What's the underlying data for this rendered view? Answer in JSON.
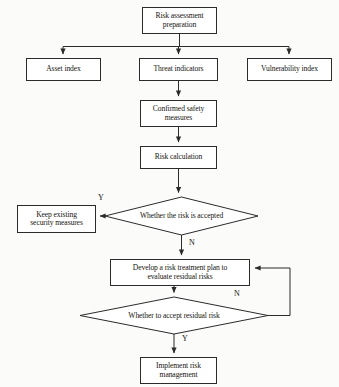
{
  "diagram": {
    "type": "flowchart",
    "background_color": "#fbfbfa",
    "stroke_color": "#2b2b2b",
    "node_fill": "#ffffff",
    "text_color": "#16150f",
    "nodes": [
      {
        "id": "start",
        "shape": "process",
        "label": "Risk assessment preparation",
        "line1": "Risk assessment",
        "line2": "preparation"
      },
      {
        "id": "asset",
        "shape": "process",
        "label": "Asset index",
        "line1": "Asset index",
        "line2": ""
      },
      {
        "id": "threat",
        "shape": "process",
        "label": "Threat indicators",
        "line1": "Threat indicators",
        "line2": ""
      },
      {
        "id": "vuln",
        "shape": "process",
        "label": "Vulnerability index",
        "line1": "Vulnerability index",
        "line2": ""
      },
      {
        "id": "confirmed",
        "shape": "process",
        "label": "Confirmed safety measures",
        "line1": "Confirmed safety",
        "line2": "measures"
      },
      {
        "id": "calc",
        "shape": "process",
        "label": "Risk calculation",
        "line1": "Risk calculation",
        "line2": ""
      },
      {
        "id": "accepted",
        "shape": "decision",
        "label": "Whether the risk is accepted",
        "line1": "Whether the risk is accepted",
        "line2": ""
      },
      {
        "id": "keep",
        "shape": "process",
        "label": "Keep existing security measures",
        "line1": "Keep existing",
        "line2": "security measures"
      },
      {
        "id": "develop",
        "shape": "process",
        "label": "Develop a risk treatment plan to evaluate residual risks",
        "line1": "Develop a risk treatment plan to",
        "line2": "evaluate residual risks"
      },
      {
        "id": "residual",
        "shape": "decision",
        "label": "Whether to accept residual risk",
        "line1": "Whether to accept residual risk",
        "line2": ""
      },
      {
        "id": "implement",
        "shape": "process",
        "label": "Implement risk management",
        "line1": "Implement risk",
        "line2": "management"
      }
    ],
    "edge_labels": [
      {
        "id": "accepted-yes",
        "text": "Y"
      },
      {
        "id": "accepted-no",
        "text": "N"
      },
      {
        "id": "residual-no",
        "text": "N"
      },
      {
        "id": "residual-yes",
        "text": "Y"
      }
    ]
  }
}
